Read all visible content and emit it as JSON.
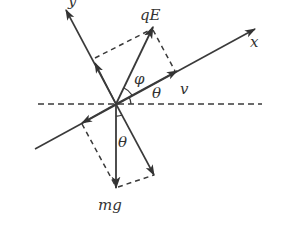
{
  "diagram": {
    "type": "force-diagram",
    "colors": {
      "line": "#3a3a3a",
      "background": "#ffffff"
    },
    "labels": {
      "x_axis": "x",
      "y_axis": "y",
      "electric_force": "qE",
      "gravity": "mg",
      "velocity": "v",
      "angle_theta_upper": "θ",
      "angle_theta_lower": "θ",
      "angle_phi": "φ"
    },
    "elements": [
      {
        "id": "origin",
        "description": "point where forces act"
      },
      {
        "id": "horizontal-reference",
        "style": "dashed"
      },
      {
        "id": "x-axis",
        "description": "inclined axis at angle θ above horizontal"
      },
      {
        "id": "y-axis",
        "description": "perpendicular to x-axis"
      },
      {
        "id": "qE-vector",
        "description": "electric force at angle φ from x-axis"
      },
      {
        "id": "mg-vector",
        "description": "gravity, vertically downward"
      },
      {
        "id": "v-vector",
        "description": "velocity along x-axis"
      }
    ]
  }
}
